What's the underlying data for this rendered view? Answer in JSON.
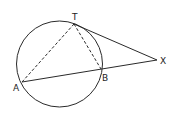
{
  "diagram": {
    "type": "geometry",
    "colors": {
      "stroke": "#2a2a2a",
      "background": "#ffffff"
    },
    "circle": {
      "cx": 59.5,
      "cy": 64,
      "r": 43
    },
    "points": {
      "T": {
        "label": "T",
        "x": 74,
        "y": 24
      },
      "A": {
        "label": "A",
        "x": 22,
        "y": 82
      },
      "B": {
        "label": "B",
        "x": 101,
        "y": 69
      },
      "X": {
        "label": "X",
        "x": 157,
        "y": 60
      }
    },
    "solid_lines": [
      [
        "T",
        "X"
      ],
      [
        "A",
        "X"
      ]
    ],
    "dashed_lines": [
      [
        "A",
        "T"
      ],
      [
        "T",
        "B"
      ]
    ]
  }
}
